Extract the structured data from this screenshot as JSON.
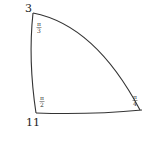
{
  "diagram": {
    "type": "spherical-triangle",
    "vertices": [
      {
        "id": "top-left",
        "label": "3",
        "angle": "π/3",
        "angle_num": "π",
        "angle_den": "3"
      },
      {
        "id": "bottom-left",
        "label": "11",
        "angle": "π/2",
        "angle_num": "π",
        "angle_den": "2"
      },
      {
        "id": "right",
        "label": "",
        "angle": "π/4",
        "angle_num": "π",
        "angle_den": "4"
      }
    ],
    "stroke_color": "#333333",
    "background": "#ffffff"
  }
}
